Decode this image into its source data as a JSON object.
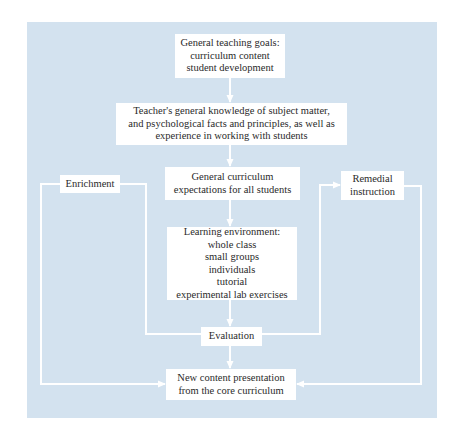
{
  "diagram": {
    "background_color": "#d3e2ef",
    "line_color": "#ffffff",
    "nodes": {
      "goals": {
        "lines": [
          "General teaching goals:",
          "curriculum content",
          "student development"
        ]
      },
      "knowledge": {
        "lines": [
          "Teacher's general knowledge of subject matter,",
          "and psychological facts and principles, as well as",
          "experience in working with students"
        ]
      },
      "expectations": {
        "lines": [
          "General curriculum",
          "expectations for all students"
        ]
      },
      "enrichment": {
        "lines": [
          "Enrichment"
        ]
      },
      "remedial": {
        "lines": [
          "Remedial",
          "instruction"
        ]
      },
      "environment": {
        "lines": [
          "Learning environment:",
          "whole class",
          "small groups",
          "individuals",
          "tutorial",
          "experimental lab exercises"
        ]
      },
      "evaluation": {
        "lines": [
          "Evaluation"
        ]
      },
      "new_content": {
        "lines": [
          "New content presentation",
          "from the core curriculum"
        ]
      }
    },
    "edges": [
      {
        "from": "goals",
        "to": "knowledge"
      },
      {
        "from": "knowledge",
        "to": "expectations"
      },
      {
        "from": "expectations",
        "to": "environment"
      },
      {
        "from": "environment",
        "to": "evaluation"
      },
      {
        "from": "evaluation",
        "to": "enrichment"
      },
      {
        "from": "evaluation",
        "to": "remedial"
      },
      {
        "from": "evaluation",
        "to": "new_content"
      },
      {
        "from": "enrichment",
        "to": "new_content"
      },
      {
        "from": "remedial",
        "to": "new_content"
      }
    ]
  }
}
